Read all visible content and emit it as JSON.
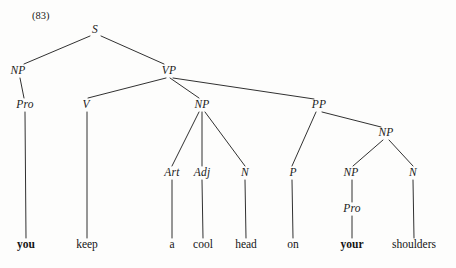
{
  "figure": {
    "example_number": "(83)",
    "sentence": "you keep a cool head on your shoulders",
    "ink_color": "#1a1a1a",
    "background_color": "#fdfdfc"
  },
  "nodes": [
    {
      "id": "s",
      "label": "S",
      "x": 95,
      "y": 30,
      "kind": "category"
    },
    {
      "id": "np_subj",
      "label": "NP",
      "x": 18,
      "y": 71,
      "kind": "category"
    },
    {
      "id": "vp",
      "label": "VP",
      "x": 169,
      "y": 71,
      "kind": "category"
    },
    {
      "id": "pro_subj",
      "label": "Pro",
      "x": 25,
      "y": 105,
      "kind": "category"
    },
    {
      "id": "v",
      "label": "V",
      "x": 86,
      "y": 105,
      "kind": "category"
    },
    {
      "id": "np_obj",
      "label": "NP",
      "x": 202,
      "y": 105,
      "kind": "category"
    },
    {
      "id": "pp",
      "label": "PP",
      "x": 319,
      "y": 105,
      "kind": "category"
    },
    {
      "id": "np_pp",
      "label": "NP",
      "x": 386,
      "y": 133,
      "kind": "category"
    },
    {
      "id": "art",
      "label": "Art",
      "x": 172,
      "y": 173,
      "kind": "category"
    },
    {
      "id": "adj",
      "label": "Adj",
      "x": 202,
      "y": 173,
      "kind": "category"
    },
    {
      "id": "n_head",
      "label": "N",
      "x": 245,
      "y": 173,
      "kind": "category"
    },
    {
      "id": "p",
      "label": "P",
      "x": 293,
      "y": 173,
      "kind": "category"
    },
    {
      "id": "np_poss",
      "label": "NP",
      "x": 351,
      "y": 173,
      "kind": "category"
    },
    {
      "id": "n_shld",
      "label": "N",
      "x": 413,
      "y": 173,
      "kind": "category"
    },
    {
      "id": "pro_poss",
      "label": "Pro",
      "x": 352,
      "y": 209,
      "kind": "category"
    }
  ],
  "terminals": [
    {
      "id": "w_you",
      "label": "you",
      "x": 26,
      "y": 245,
      "bold": true
    },
    {
      "id": "w_keep",
      "label": "keep",
      "x": 87,
      "y": 245,
      "bold": false
    },
    {
      "id": "w_a",
      "label": "a",
      "x": 172,
      "y": 245,
      "bold": false
    },
    {
      "id": "w_cool",
      "label": "cool",
      "x": 203,
      "y": 245,
      "bold": false
    },
    {
      "id": "w_head",
      "label": "head",
      "x": 246,
      "y": 245,
      "bold": false
    },
    {
      "id": "w_on",
      "label": "on",
      "x": 293,
      "y": 245,
      "bold": false
    },
    {
      "id": "w_your",
      "label": "your",
      "x": 352,
      "y": 245,
      "bold": true
    },
    {
      "id": "w_shoulders",
      "label": "shoulders",
      "x": 414,
      "y": 245,
      "bold": false
    }
  ],
  "edges": [
    {
      "from": "s",
      "to": "np_subj",
      "x1": 90,
      "y1": 36,
      "x2": 24,
      "y2": 64
    },
    {
      "from": "s",
      "to": "vp",
      "x1": 101,
      "y1": 36,
      "x2": 164,
      "y2": 64
    },
    {
      "from": "np_subj",
      "to": "pro_subj",
      "x1": 20,
      "y1": 78,
      "x2": 24,
      "y2": 98
    },
    {
      "from": "pro_subj",
      "to": "w_you",
      "x1": 25,
      "y1": 112,
      "x2": 26,
      "y2": 238
    },
    {
      "from": "vp",
      "to": "v",
      "x1": 166,
      "y1": 78,
      "x2": 88,
      "y2": 98
    },
    {
      "from": "vp",
      "to": "np_obj",
      "x1": 170,
      "y1": 78,
      "x2": 199,
      "y2": 98
    },
    {
      "from": "vp",
      "to": "pp",
      "x1": 173,
      "y1": 78,
      "x2": 314,
      "y2": 99
    },
    {
      "from": "v",
      "to": "w_keep",
      "x1": 87,
      "y1": 112,
      "x2": 87,
      "y2": 238
    },
    {
      "from": "np_obj",
      "to": "art",
      "x1": 199,
      "y1": 112,
      "x2": 172,
      "y2": 166
    },
    {
      "from": "np_obj",
      "to": "adj",
      "x1": 202,
      "y1": 112,
      "x2": 202,
      "y2": 166
    },
    {
      "from": "np_obj",
      "to": "n_head",
      "x1": 205,
      "y1": 112,
      "x2": 245,
      "y2": 166
    },
    {
      "from": "art",
      "to": "w_a",
      "x1": 172,
      "y1": 180,
      "x2": 172,
      "y2": 238
    },
    {
      "from": "adj",
      "to": "w_cool",
      "x1": 202,
      "y1": 180,
      "x2": 203,
      "y2": 238
    },
    {
      "from": "n_head",
      "to": "w_head",
      "x1": 245,
      "y1": 180,
      "x2": 246,
      "y2": 238
    },
    {
      "from": "pp",
      "to": "p",
      "x1": 316,
      "y1": 112,
      "x2": 292,
      "y2": 166
    },
    {
      "from": "pp",
      "to": "np_pp",
      "x1": 322,
      "y1": 112,
      "x2": 381,
      "y2": 127
    },
    {
      "from": "p",
      "to": "w_on",
      "x1": 292,
      "y1": 180,
      "x2": 293,
      "y2": 238
    },
    {
      "from": "np_pp",
      "to": "np_poss",
      "x1": 383,
      "y1": 140,
      "x2": 353,
      "y2": 166
    },
    {
      "from": "np_pp",
      "to": "n_shld",
      "x1": 389,
      "y1": 140,
      "x2": 413,
      "y2": 166
    },
    {
      "from": "np_poss",
      "to": "pro_poss",
      "x1": 352,
      "y1": 180,
      "x2": 352,
      "y2": 202
    },
    {
      "from": "pro_poss",
      "to": "w_your",
      "x1": 352,
      "y1": 216,
      "x2": 352,
      "y2": 238
    },
    {
      "from": "n_shld",
      "to": "w_shoulders",
      "x1": 413,
      "y1": 180,
      "x2": 414,
      "y2": 238
    }
  ]
}
